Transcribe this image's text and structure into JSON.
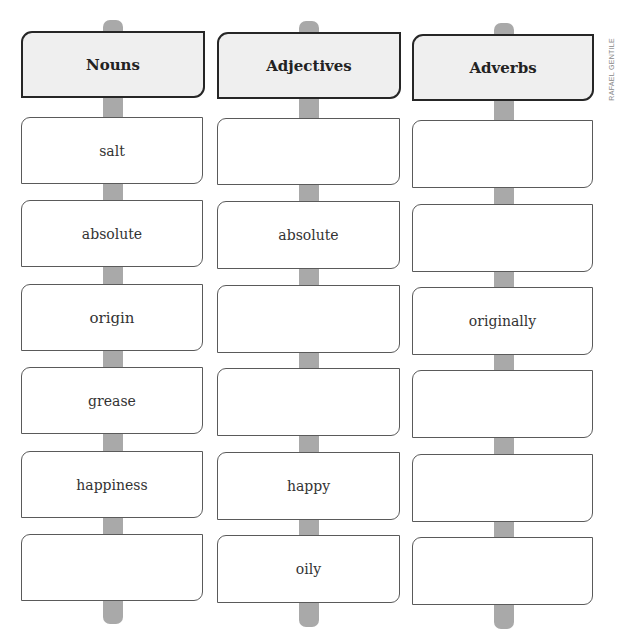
{
  "credit": "RAFAEL GENTILE",
  "columns": [
    {
      "header": "Nouns",
      "cells": [
        "salt",
        "absolute",
        "origin",
        "grease",
        "happiness",
        ""
      ]
    },
    {
      "header": "Adjectives",
      "cells": [
        "",
        "absolute",
        "",
        "",
        "happy",
        "oily"
      ]
    },
    {
      "header": "Adverbs",
      "cells": [
        "",
        "",
        "originally",
        "",
        "",
        ""
      ]
    }
  ]
}
